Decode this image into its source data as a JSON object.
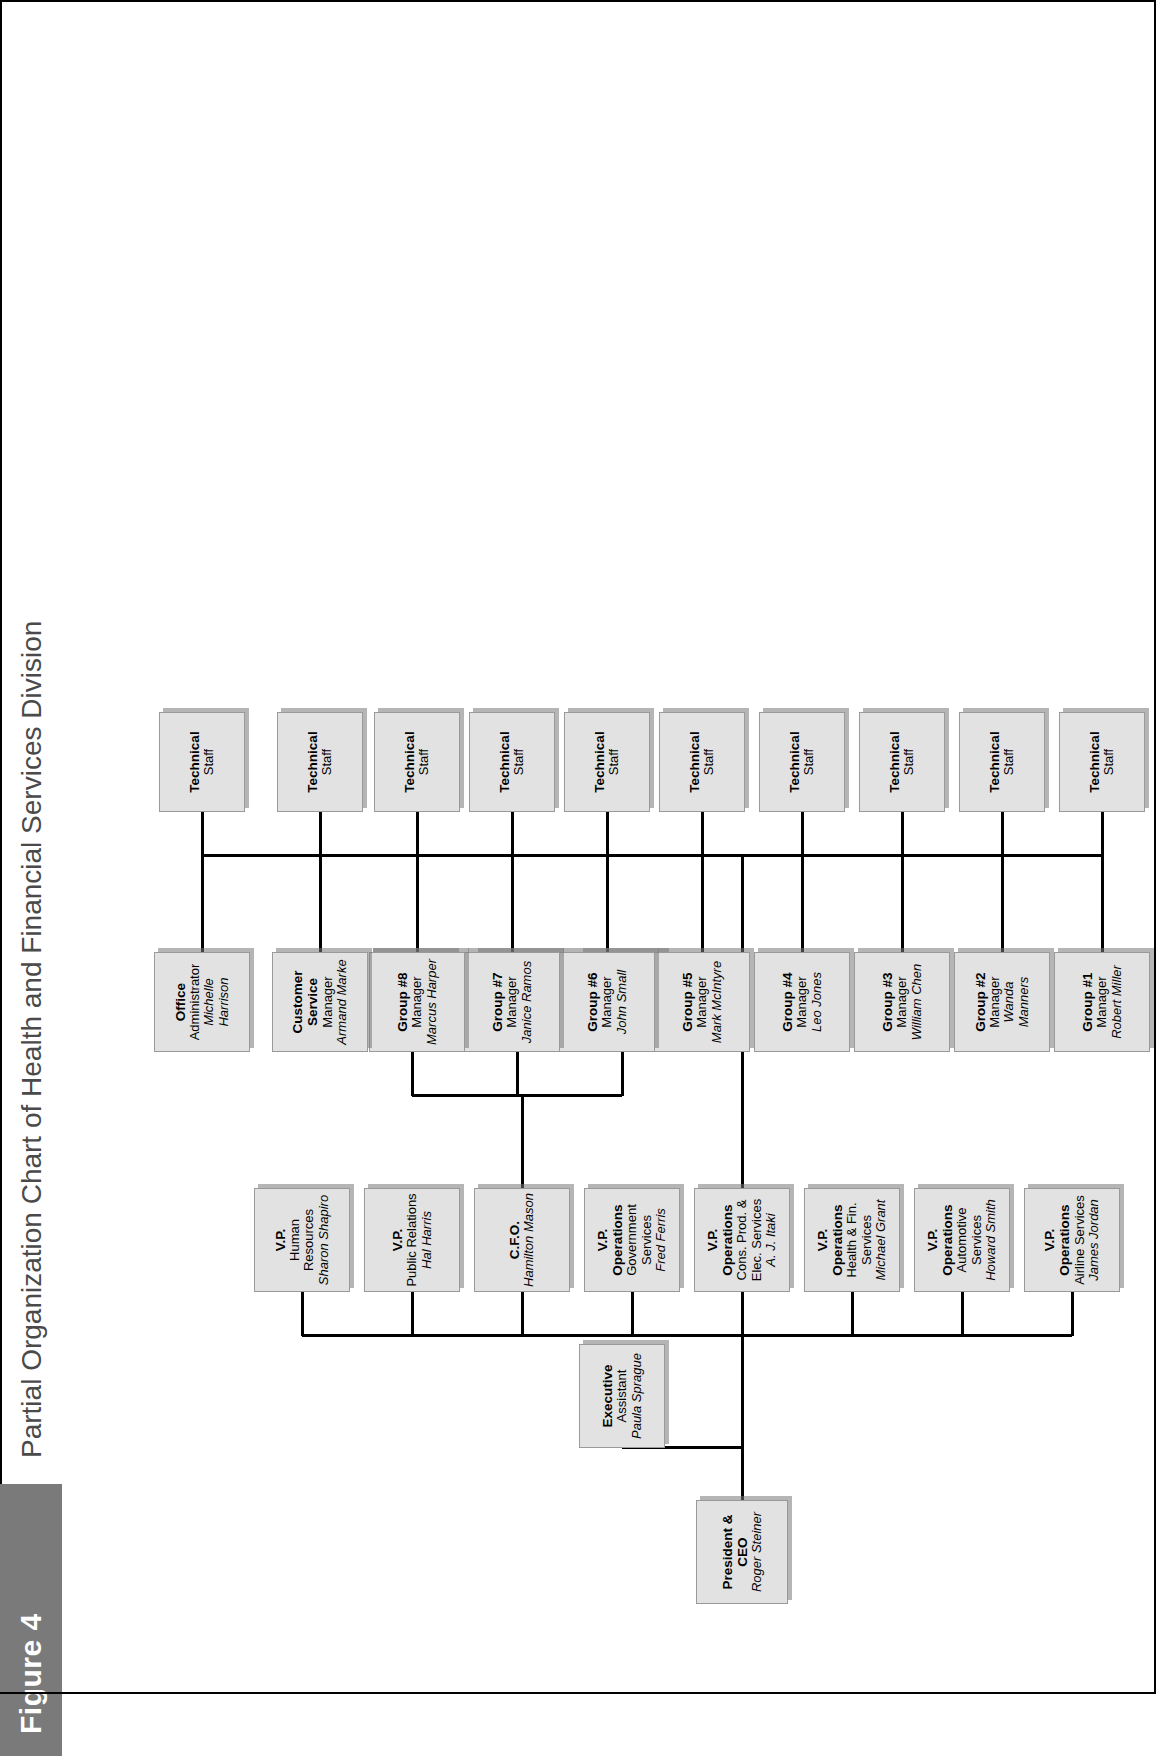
{
  "figure": {
    "label": "Figure 4",
    "title": "Partial Organization Chart of Health and Financial Services Division"
  },
  "colors": {
    "figure_tag_bg": "#7a7a7a",
    "box_fill": "#e2e2e2",
    "box_border": "#9a9a9a",
    "line": "#000000",
    "title_text": "#4a4a4a"
  },
  "chart_data": {
    "type": "diagram",
    "subtype": "org-chart",
    "title": "Partial Organization Chart of Health and Financial Services Division",
    "nodes": [
      {
        "id": "ceo",
        "title": "President & CEO",
        "sub": "",
        "name": "Roger Steiner",
        "level": 0
      },
      {
        "id": "exec",
        "title": "Executive",
        "sub": "Assistant",
        "name": "Paula Sprague",
        "level": 1
      },
      {
        "id": "vp_air",
        "title": "V.P. Operations",
        "sub": "Airline Services",
        "name": "James Jordan",
        "level": 2
      },
      {
        "id": "vp_auto",
        "title": "V.P. Operations",
        "sub": "Automotive Services",
        "name": "Howard Smith",
        "level": 2
      },
      {
        "id": "vp_hf",
        "title": "V.P. Operations",
        "sub": "Health & Fin. Services",
        "name": "Michael Grant",
        "level": 2
      },
      {
        "id": "vp_cons",
        "title": "V.P. Operations",
        "sub": "Cons. Prod. & Elec. Services",
        "name": "A. J. Itaki",
        "level": 2
      },
      {
        "id": "vp_gov",
        "title": "V.P. Operations",
        "sub": "Government Services",
        "name": "Fred Ferris",
        "level": 2
      },
      {
        "id": "cfo",
        "title": "C.F.O.",
        "sub": "",
        "name": "Hamilton Mason",
        "level": 2
      },
      {
        "id": "vp_pr",
        "title": "V.P.",
        "sub": "Public Relations",
        "name": "Hal Harris",
        "level": 2
      },
      {
        "id": "vp_hr",
        "title": "V.P.",
        "sub": "Human Resources",
        "name": "Sharon Shapiro",
        "level": 2
      },
      {
        "id": "treasurer",
        "title": "Treasurer.",
        "sub": "",
        "name": "Jason Means",
        "level": 3
      },
      {
        "id": "controller",
        "title": "Controller",
        "sub": "",
        "name": "Ian Herman",
        "level": 3
      },
      {
        "id": "dir_admin",
        "title": "Director",
        "sub": "Admin. Services",
        "name": "Jason Hanson",
        "level": 3
      },
      {
        "id": "grp1",
        "title": "Group #1",
        "sub": "Manager",
        "name": "Robert Miller",
        "level": 3
      },
      {
        "id": "grp2",
        "title": "Group #2",
        "sub": "Manager",
        "name": "Wanda Manners",
        "level": 3
      },
      {
        "id": "grp3",
        "title": "Group #3",
        "sub": "Manager",
        "name": "William Chen",
        "level": 3
      },
      {
        "id": "grp4",
        "title": "Group #4",
        "sub": "Manager",
        "name": "Leo Jones",
        "level": 3
      },
      {
        "id": "grp5",
        "title": "Group #5",
        "sub": "Manager",
        "name": "Mark McIntyre",
        "level": 3
      },
      {
        "id": "grp6",
        "title": "Group #6",
        "sub": "Manager",
        "name": "John Small",
        "level": 3
      },
      {
        "id": "grp7",
        "title": "Group #7",
        "sub": "Manager",
        "name": "Janice Ramos",
        "level": 3
      },
      {
        "id": "grp8",
        "title": "Group #8",
        "sub": "Manager",
        "name": "Marcus Harper",
        "level": 3
      },
      {
        "id": "cust_svc",
        "title": "Customer Service",
        "sub": "Manager",
        "name": "Armand Marke",
        "level": 3
      },
      {
        "id": "office_adm",
        "title": "Office",
        "sub": "Administrator",
        "name": "Michelle Harrison",
        "level": 3
      },
      {
        "id": "ts1",
        "title": "Technical",
        "sub": "Staff",
        "name": "",
        "level": 4
      },
      {
        "id": "ts2",
        "title": "Technical",
        "sub": "Staff",
        "name": "",
        "level": 4
      },
      {
        "id": "ts3",
        "title": "Technical",
        "sub": "Staff",
        "name": "",
        "level": 4
      },
      {
        "id": "ts4",
        "title": "Technical",
        "sub": "Staff",
        "name": "",
        "level": 4
      },
      {
        "id": "ts5",
        "title": "Technical",
        "sub": "Staff",
        "name": "",
        "level": 4
      },
      {
        "id": "ts6",
        "title": "Technical",
        "sub": "Staff",
        "name": "",
        "level": 4
      },
      {
        "id": "ts7",
        "title": "Technical",
        "sub": "Staff",
        "name": "",
        "level": 4
      },
      {
        "id": "ts8",
        "title": "Technical",
        "sub": "Staff",
        "name": "",
        "level": 4
      },
      {
        "id": "ts9",
        "title": "Technical",
        "sub": "Staff",
        "name": "",
        "level": 4
      },
      {
        "id": "ts10",
        "title": "Technical",
        "sub": "Staff",
        "name": "",
        "level": 4
      }
    ],
    "edges": [
      [
        "ceo",
        "exec"
      ],
      [
        "ceo",
        "vp_air"
      ],
      [
        "ceo",
        "vp_auto"
      ],
      [
        "ceo",
        "vp_hf"
      ],
      [
        "ceo",
        "vp_cons"
      ],
      [
        "ceo",
        "vp_gov"
      ],
      [
        "ceo",
        "cfo"
      ],
      [
        "ceo",
        "vp_pr"
      ],
      [
        "ceo",
        "vp_hr"
      ],
      [
        "cfo",
        "treasurer"
      ],
      [
        "cfo",
        "controller"
      ],
      [
        "cfo",
        "dir_admin"
      ],
      [
        "vp_cons",
        "grp1"
      ],
      [
        "vp_cons",
        "grp2"
      ],
      [
        "vp_cons",
        "grp3"
      ],
      [
        "vp_cons",
        "grp4"
      ],
      [
        "vp_cons",
        "grp5"
      ],
      [
        "vp_cons",
        "grp6"
      ],
      [
        "vp_cons",
        "grp7"
      ],
      [
        "vp_cons",
        "grp8"
      ],
      [
        "vp_cons",
        "cust_svc"
      ],
      [
        "vp_cons",
        "office_adm"
      ],
      [
        "grp1",
        "ts1"
      ],
      [
        "grp2",
        "ts2"
      ],
      [
        "grp3",
        "ts3"
      ],
      [
        "grp4",
        "ts4"
      ],
      [
        "grp5",
        "ts5"
      ],
      [
        "grp6",
        "ts6"
      ],
      [
        "grp7",
        "ts7"
      ],
      [
        "grp8",
        "ts8"
      ],
      [
        "cust_svc",
        "ts9"
      ],
      [
        "office_adm",
        "ts10"
      ]
    ]
  }
}
